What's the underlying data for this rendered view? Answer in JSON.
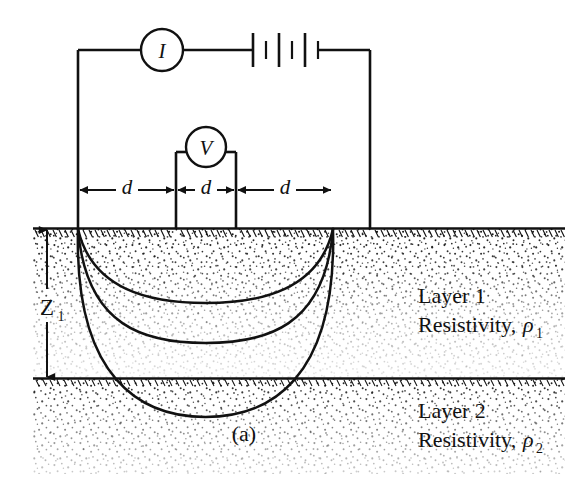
{
  "figure": {
    "caption": "(a)",
    "type": "wenner-four-electrode-resistivity-survey-diagram",
    "instruments": {
      "ammeter_label": "I",
      "voltmeter_label": "V",
      "battery_label": ""
    },
    "spacing_labels": [
      "d",
      "d",
      "d"
    ],
    "depth_label_base": "Z",
    "depth_label_sub": "1",
    "layers": [
      {
        "name": "Layer 1",
        "resistivity_prefix": "Resistivity, ",
        "resistivity_symbol": "ρ",
        "resistivity_sub": "1"
      },
      {
        "name": "Layer 2",
        "resistivity_prefix": "Resistivity, ",
        "resistivity_symbol": "ρ",
        "resistivity_sub": "2"
      }
    ],
    "colors": {
      "line": "#111111",
      "stipple": "#1a1a1a",
      "background": "#ffffff"
    },
    "geometry": {
      "electrodes_x": [
        78,
        176,
        236,
        333
      ],
      "ground_surface_y": 228,
      "layer_interface_y": 378,
      "arc_depths_y": [
        303,
        343,
        417
      ]
    }
  }
}
